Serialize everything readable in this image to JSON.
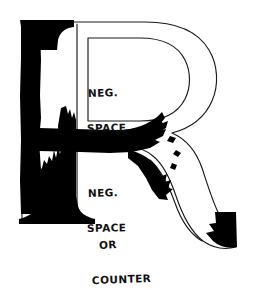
{
  "figure": {
    "kind": "hand-drawn-typography-diagram",
    "subject_letter": "R",
    "background_color": "#ffffff",
    "ink_color": "#000000",
    "outline_color": "#1a1a1a"
  },
  "annotations": [
    {
      "id": "neg-space-bowl",
      "line1": "NEG.",
      "line2": "SPACE",
      "points_at": "bowl-counter"
    },
    {
      "id": "neg-space-leg",
      "line1": "NEG.",
      "line2": "SPACE",
      "points_at": "leg-negative-space"
    },
    {
      "id": "or-counter",
      "line1": "OR",
      "line2": "COUNTER",
      "points_at": "lower-negative-space"
    }
  ],
  "letterform": {
    "stem": {
      "name": "stem",
      "top_serif": "bracketed-serif",
      "bottom_serif": "bracketed-serif",
      "fill": "black-with-ragged-erosion"
    },
    "bowl": {
      "name": "bowl",
      "fill": "outline-only",
      "stroke_width_px": 1.2
    },
    "leg": {
      "name": "leg",
      "fill": "outline-only-with-black-terminal",
      "terminal": "black-wedge"
    },
    "shoulder_bar": {
      "name": "shoulder-bar",
      "fill": "solid-black-brushstroke"
    }
  }
}
